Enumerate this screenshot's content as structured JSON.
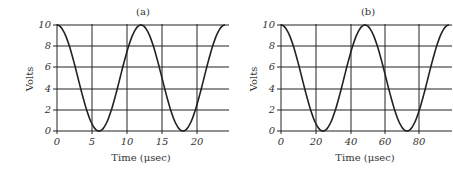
{
  "chart_data": [
    {
      "type": "line",
      "title": "(a)",
      "xlabel": "Time (μsec)",
      "ylabel": "Volts",
      "xticks": [
        0,
        5,
        10,
        15,
        20
      ],
      "xtick_labels": [
        "0",
        "5",
        "10",
        "15",
        "20"
      ],
      "yticks": [
        0,
        2,
        4,
        6,
        8,
        10
      ],
      "ytick_labels": [
        "0",
        "2",
        "4",
        "6",
        "8",
        "10"
      ],
      "xlim": [
        0,
        24
      ],
      "ylim": [
        0,
        10
      ],
      "grid": true,
      "function": "5 + 5*cos(2*pi*t/12)",
      "period": 12,
      "series": [
        {
          "name": "voltage",
          "x": [
            0,
            3,
            6,
            9,
            12,
            15,
            18,
            21,
            24
          ],
          "values": [
            10,
            5,
            0,
            5,
            10,
            5,
            0,
            5,
            10
          ]
        }
      ]
    },
    {
      "type": "line",
      "title": "(b)",
      "xlabel": "Time (μsec)",
      "ylabel": "Volts",
      "xticks": [
        0,
        20,
        40,
        60,
        80
      ],
      "xtick_labels": [
        "0",
        "20",
        "40",
        "60",
        "80"
      ],
      "yticks": [
        0,
        2,
        4,
        6,
        8,
        10
      ],
      "ytick_labels": [
        "0",
        "2",
        "4",
        "6",
        "8",
        "10"
      ],
      "xlim": [
        0,
        96
      ],
      "ylim": [
        0,
        10
      ],
      "grid": true,
      "function": "5 + 5*cos(2*pi*t/48)",
      "period": 48,
      "series": [
        {
          "name": "voltage",
          "x": [
            0,
            12,
            24,
            36,
            48,
            60,
            72,
            84,
            96
          ],
          "values": [
            10,
            5,
            0,
            5,
            10,
            5,
            0,
            5,
            10
          ]
        }
      ]
    }
  ],
  "charts": {
    "a": {
      "title": "(a)",
      "xlabel": "Time (μsec)",
      "ylabel": "Volts",
      "xtick": [
        "0",
        "5",
        "10",
        "15",
        "20"
      ],
      "ytick": [
        "0",
        "2",
        "4",
        "6",
        "8",
        "10"
      ]
    },
    "b": {
      "title": "(b)",
      "xlabel": "Time (μsec)",
      "ylabel": "Volts",
      "xtick": [
        "0",
        "20",
        "40",
        "60",
        "80"
      ],
      "ytick": [
        "0",
        "2",
        "4",
        "6",
        "8",
        "10"
      ]
    }
  }
}
